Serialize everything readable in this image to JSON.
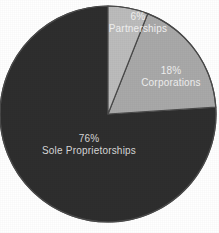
{
  "chart_data": {
    "type": "pie",
    "title": "",
    "subtitle": "",
    "xlabel": "",
    "ylabel": "",
    "legend_position": "none",
    "grid": false,
    "labels_inside_slices": true,
    "categories": [
      "Sole Proprietorships",
      "Corporations",
      "Partnerships"
    ],
    "values": [
      76,
      18,
      6
    ],
    "unit": "%",
    "slices": [
      {
        "name": "Sole Proprietorships",
        "value": 76,
        "percent_label": "76%",
        "color": "#2e2e2e",
        "label_color": "#d8d8d8",
        "start_angle_deg": 108,
        "sweep_deg": 273.6
      },
      {
        "name": "Corporations",
        "value": 18,
        "percent_label": "18%",
        "color": "#a9a9a9",
        "label_color": "#f0f0f0",
        "start_angle_deg": 21.6,
        "sweep_deg": 64.8
      },
      {
        "name": "Partnerships",
        "value": 6,
        "percent_label": "6%",
        "color": "#bcbcbc",
        "label_color": "#f2f2f2",
        "start_angle_deg": 0,
        "sweep_deg": 21.6
      }
    ]
  },
  "chart": {
    "background_color": "#ffffff",
    "outline_color": "#4a4a4a",
    "labels": {
      "sole": {
        "percent": "76%",
        "name": "Sole Proprietorships"
      },
      "corporations": {
        "percent": "18%",
        "name": "Corporations"
      },
      "partnerships": {
        "percent": "6%",
        "name": "Partnerships"
      }
    }
  }
}
